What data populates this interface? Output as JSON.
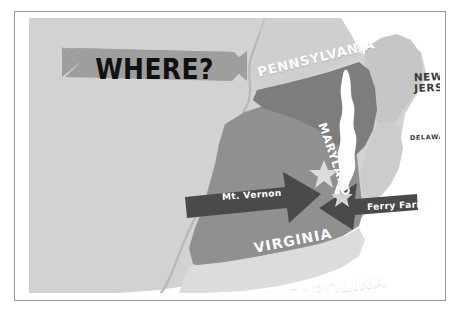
{
  "figure": {
    "kind": "illustrated-map",
    "region": "US Mid-Atlantic"
  },
  "banner": {
    "title": "WHERE?",
    "shape": "notched-ribbon",
    "fill_color": "#9e9e9e",
    "text_color": "#111111"
  },
  "frame": {
    "border_color": "#9a9a9a",
    "page_background": "#ffffff"
  },
  "palette": {
    "background_land": "#d2d2d2",
    "ocean": "#ffffff",
    "virginia_fill": "#909090",
    "maryland_fill": "#7d7d7d",
    "peninsula_fill": "#c6c6c6",
    "callout_fill": "#4a4a4a",
    "star_fill": "#d9d9d9",
    "boundary_line": "#b4b4b4"
  },
  "map": {
    "state_labels": [
      {
        "id": "pennsylvania",
        "name": "PENNSYLVANIA",
        "text": "PENNSYLVANIA",
        "style": "white",
        "rotation_deg": -14
      },
      {
        "id": "new-jersey",
        "name": "NEW JERSEY",
        "line1": "NEW",
        "line2": "JERSEY",
        "style": "dark",
        "rotation_deg": -2
      },
      {
        "id": "delaware",
        "name": "DELAWARE",
        "text": "DELAWARE",
        "style": "dark",
        "rotation_deg": -2
      },
      {
        "id": "maryland",
        "name": "MARYLAND",
        "text": "MARYLAND",
        "style": "white",
        "rotation_deg": 71
      },
      {
        "id": "virginia",
        "name": "VIRGINIA",
        "text": "VIRGINIA",
        "style": "white",
        "rotation_deg": -11
      },
      {
        "id": "north-carolina",
        "name": "NORTH CAROLINA",
        "text": "NORTH CAROLINA",
        "style": "white",
        "rotation_deg": -8
      }
    ],
    "callouts": [
      {
        "id": "mt-vernon",
        "label": "Mt. Vernon",
        "direction": "right"
      },
      {
        "id": "ferry-farm",
        "label": "Ferry Farm",
        "direction": "left"
      }
    ],
    "markers": [
      {
        "id": "star-mt-vernon",
        "shape": "star",
        "size": "large"
      },
      {
        "id": "star-ferry-farm",
        "shape": "star",
        "size": "small"
      }
    ],
    "water_features": [
      {
        "id": "chesapeake-bay",
        "shape": "bay",
        "fill": "#ffffff"
      }
    ]
  }
}
